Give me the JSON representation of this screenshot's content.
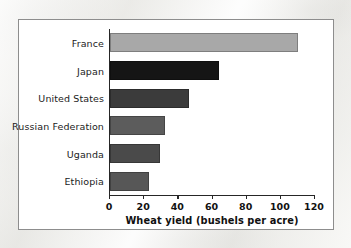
{
  "figure": {
    "panel_background": "#ffffff",
    "panel_border": "#8d8d8d",
    "page_background": "#f1f0ee"
  },
  "chart_data": {
    "type": "bar",
    "orientation": "horizontal",
    "title": "",
    "subtitle": "",
    "xlabel": "Wheat yield (bushels per acre)",
    "ylabel": "",
    "categories": [
      "France",
      "Japan",
      "United States",
      "Russian Federation",
      "Uganda",
      "Ethiopia"
    ],
    "values": [
      110,
      64,
      46,
      32,
      29,
      23
    ],
    "bar_colors": [
      "#a8a8a8",
      "#151515",
      "#3b3b3b",
      "#5c5c5c",
      "#4a4a4a",
      "#575757"
    ],
    "xlim": [
      0,
      120
    ],
    "xticks": [
      0,
      20,
      40,
      60,
      80,
      100,
      120
    ],
    "xtick_labels": [
      "0",
      "20",
      "40",
      "60",
      "80",
      "100",
      "120"
    ],
    "grid": false,
    "legend": false,
    "legend_position": "none",
    "axis_color": "#262626"
  }
}
